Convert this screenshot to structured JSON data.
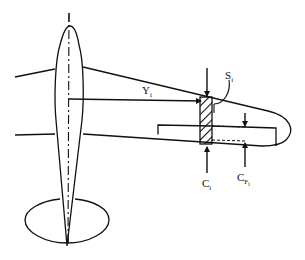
{
  "figure": {
    "labels": {
      "Y": {
        "main": "Y",
        "sub": "i"
      },
      "S": {
        "main": "S",
        "sub": "i"
      },
      "C": {
        "main": "C",
        "sub": "i"
      },
      "CF": {
        "main": "C",
        "sub": "F",
        "subsub": "i"
      }
    },
    "colors": {
      "stroke": "#111111",
      "background": "#ffffff"
    }
  }
}
